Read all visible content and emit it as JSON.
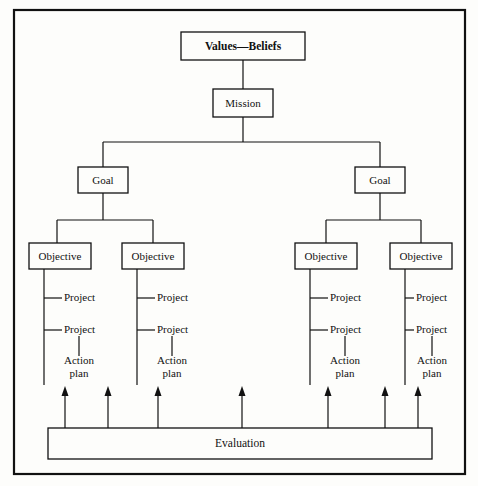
{
  "diagram": {
    "root": {
      "label": "Values—Beliefs"
    },
    "mission": {
      "label": "Mission"
    },
    "goals": [
      {
        "label": "Goal"
      },
      {
        "label": "Goal"
      }
    ],
    "objectives": [
      {
        "label": "Objective"
      },
      {
        "label": "Objective"
      },
      {
        "label": "Objective"
      },
      {
        "label": "Objective"
      }
    ],
    "branches": [
      {
        "projects": [
          "Project",
          "Project"
        ],
        "action_plan": {
          "line1": "Action",
          "line2": "plan"
        }
      },
      {
        "projects": [
          "Project",
          "Project"
        ],
        "action_plan": {
          "line1": "Action",
          "line2": "plan"
        }
      },
      {
        "projects": [
          "Project",
          "Project"
        ],
        "action_plan": {
          "line1": "Action",
          "line2": "plan"
        }
      },
      {
        "projects": [
          "Project",
          "Project"
        ],
        "action_plan": {
          "line1": "Action",
          "line2": "plan"
        }
      }
    ],
    "evaluation": {
      "label": "Evaluation"
    },
    "feedback_arrow_count": 7,
    "colors": {
      "line": "#111111",
      "box_fill": "#fdfdfb",
      "page_background": "#fdfdfb",
      "text": "#111111"
    }
  }
}
